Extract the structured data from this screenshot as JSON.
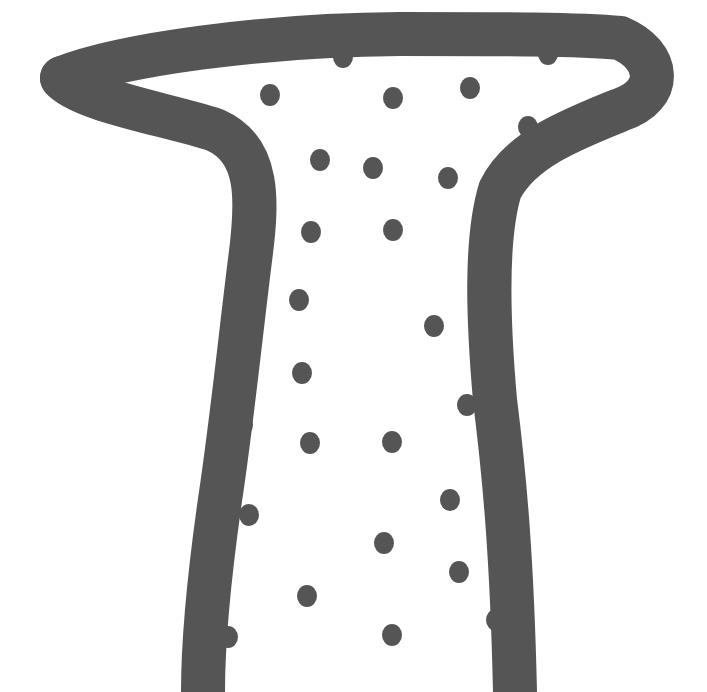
{
  "image": {
    "description": "Abstract ink drawing of a vase/stool-like outline with scattered dots inside",
    "colors": {
      "ink": "#555555",
      "background": "#ffffff"
    },
    "dots": [
      [
        343,
        57
      ],
      [
        548,
        54
      ],
      [
        270,
        95
      ],
      [
        393,
        98
      ],
      [
        470,
        88
      ],
      [
        528,
        127
      ],
      [
        320,
        160
      ],
      [
        373,
        168
      ],
      [
        448,
        178
      ],
      [
        311,
        232
      ],
      [
        393,
        230
      ],
      [
        299,
        300
      ],
      [
        252,
        314
      ],
      [
        434,
        326
      ],
      [
        302,
        373
      ],
      [
        467,
        405
      ],
      [
        243,
        425
      ],
      [
        310,
        443
      ],
      [
        392,
        442
      ],
      [
        450,
        500
      ],
      [
        249,
        515
      ],
      [
        384,
        543
      ],
      [
        459,
        572
      ],
      [
        307,
        596
      ],
      [
        496,
        620
      ],
      [
        228,
        637
      ],
      [
        392,
        635
      ]
    ]
  }
}
